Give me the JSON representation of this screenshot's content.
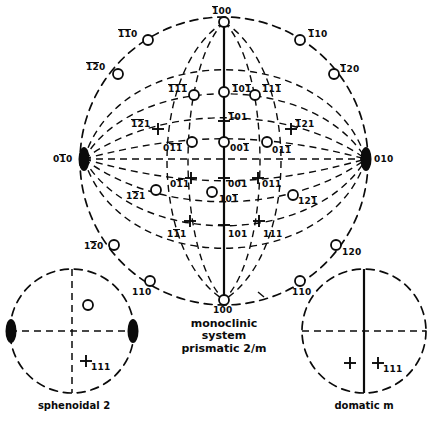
{
  "figure": {
    "title": "monoclinic system prismatic 2/m",
    "main_caption_lines": [
      "monoclinic",
      "system",
      "prismatic 2/m"
    ],
    "sub_figures": [
      {
        "caption": "sphenoidal 2",
        "symbol": "2"
      },
      {
        "caption": "domatic m",
        "symbol": "m"
      }
    ],
    "colors": {
      "ink": "#0b0b0b",
      "background": "#ffffff"
    }
  },
  "main_stereogram": {
    "name": "monoclinic prismatic 2/m stereographic projection",
    "poles": [
      {
        "id": "p-1b00",
        "label": "100",
        "bars": [
          0
        ],
        "marker": "circle",
        "x": 224,
        "y": 22,
        "lx": 212,
        "ly": 7
      },
      {
        "id": "p-1b1b0",
        "label": "110",
        "bars": [
          0,
          1
        ],
        "marker": "circle",
        "x": 148,
        "y": 40,
        "lx": 118,
        "ly": 30
      },
      {
        "id": "p-1b2b0",
        "label": "120",
        "bars": [
          0,
          1
        ],
        "marker": "circle",
        "x": 118,
        "y": 74,
        "lx": 86,
        "ly": 63
      },
      {
        "id": "p-1b10",
        "label": "110",
        "bars": [
          0
        ],
        "marker": "circle",
        "x": 300,
        "y": 40,
        "lx": 308,
        "ly": 30
      },
      {
        "id": "p-1b20",
        "label": "120",
        "bars": [
          0
        ],
        "marker": "circle",
        "x": 334,
        "y": 74,
        "lx": 340,
        "ly": 65
      },
      {
        "id": "p-1b1b1",
        "label": "111",
        "bars": [
          0,
          1,
          2
        ],
        "marker": "circle",
        "x": 194,
        "y": 95,
        "lx": 168,
        "ly": 85
      },
      {
        "id": "p-1b0b1",
        "label": "101",
        "bars": [
          0,
          2
        ],
        "marker": "circle",
        "x": 224,
        "y": 92,
        "lx": 232,
        "ly": 85
      },
      {
        "id": "p-1b11b",
        "label": "111",
        "bars": [
          0,
          2
        ],
        "marker": "circle",
        "x": 255,
        "y": 95,
        "lx": 262,
        "ly": 85
      },
      {
        "id": "p-1b01",
        "label": "101",
        "bars": [
          0
        ],
        "marker": "cross",
        "x": 224,
        "y": 121,
        "lx": 228,
        "ly": 113
      },
      {
        "id": "p-1b2b1",
        "label": "121",
        "bars": [
          0,
          1
        ],
        "marker": "cross",
        "x": 158,
        "y": 129,
        "lx": 131,
        "ly": 120
      },
      {
        "id": "p-1b21",
        "label": "121",
        "bars": [
          0
        ],
        "marker": "cross",
        "x": 291,
        "y": 129,
        "lx": 295,
        "ly": 120
      },
      {
        "id": "p-01b1b",
        "label": "011",
        "bars": [
          1,
          2
        ],
        "marker": "circle",
        "x": 192,
        "y": 142,
        "lx": 163,
        "ly": 144
      },
      {
        "id": "p-001b",
        "label": "001",
        "bars": [
          2
        ],
        "marker": "circle",
        "x": 224,
        "y": 142,
        "lx": 230,
        "ly": 144
      },
      {
        "id": "p-011b",
        "label": "011",
        "bars": [
          2
        ],
        "marker": "circle",
        "x": 267,
        "y": 142,
        "lx": 272,
        "ly": 146
      },
      {
        "id": "p-0b10",
        "label": "010",
        "bars": [
          1
        ],
        "marker": "lens",
        "x": 84,
        "y": 159,
        "lx": 53,
        "ly": 155
      },
      {
        "id": "p-010",
        "label": "010",
        "bars": [],
        "marker": "lens",
        "x": 366,
        "y": 159,
        "lx": 374,
        "ly": 155
      },
      {
        "id": "p-01b1",
        "label": "011",
        "bars": [
          1
        ],
        "marker": "cross",
        "x": 191,
        "y": 178,
        "lx": 170,
        "ly": 180
      },
      {
        "id": "p-001",
        "label": "001",
        "bars": [],
        "marker": "cross",
        "x": 224,
        "y": 178,
        "lx": 228,
        "ly": 180
      },
      {
        "id": "p-011",
        "label": "011",
        "bars": [],
        "marker": "cross",
        "x": 258,
        "y": 178,
        "lx": 262,
        "ly": 180
      },
      {
        "id": "p-101b",
        "label": "101",
        "bars": [
          2
        ],
        "marker": "circle",
        "x": 212,
        "y": 192,
        "lx": 219,
        "ly": 195
      },
      {
        "id": "p-12b1",
        "label": "121",
        "bars": [
          1
        ],
        "marker": "circle",
        "x": 156,
        "y": 190,
        "lx": 126,
        "ly": 192
      },
      {
        "id": "p-121b",
        "label": "121",
        "bars": [
          2
        ],
        "marker": "circle",
        "x": 293,
        "y": 195,
        "lx": 298,
        "ly": 197
      },
      {
        "id": "p-1b11",
        "label": "111",
        "bars": [
          1
        ],
        "marker": "cross",
        "x": 190,
        "y": 221,
        "lx": 167,
        "ly": 230
      },
      {
        "id": "p-101",
        "label": "101",
        "bars": [],
        "marker": "cross",
        "x": 224,
        "y": 225,
        "lx": 228,
        "ly": 230
      },
      {
        "id": "p-111",
        "label": "111",
        "bars": [],
        "marker": "cross",
        "x": 259,
        "y": 221,
        "lx": 263,
        "ly": 230
      },
      {
        "id": "p-1b2b0b",
        "label": "120",
        "bars": [
          1
        ],
        "marker": "circle",
        "x": 114,
        "y": 245,
        "lx": 84,
        "ly": 242
      },
      {
        "id": "p-120",
        "label": "120",
        "bars": [],
        "marker": "circle",
        "x": 336,
        "y": 245,
        "lx": 342,
        "ly": 248
      },
      {
        "id": "p-1b10b",
        "label": "110",
        "bars": [],
        "marker": "circle",
        "x": 150,
        "y": 281,
        "lx": 132,
        "ly": 288
      },
      {
        "id": "p-110",
        "label": "110",
        "bars": [],
        "marker": "circle",
        "x": 300,
        "y": 281,
        "lx": 292,
        "ly": 288
      },
      {
        "id": "p-100",
        "label": "100",
        "bars": [],
        "marker": "circle",
        "x": 224,
        "y": 300,
        "lx": 213,
        "ly": 306
      }
    ]
  },
  "sphenoidal_stereogram": {
    "name": "sphenoidal 2",
    "poles": [
      {
        "id": "s-upper",
        "label": "",
        "marker": "circle",
        "x": 88,
        "y": 305
      },
      {
        "id": "s-lens-left",
        "label": "",
        "marker": "lens",
        "x": 11,
        "y": 331
      },
      {
        "id": "s-lens-right",
        "label": "",
        "marker": "lens",
        "x": 133,
        "y": 331
      },
      {
        "id": "s-cross-111",
        "label": "111",
        "bars": [],
        "marker": "cross",
        "x": 86,
        "y": 361,
        "lx": 91,
        "ly": 363
      }
    ]
  },
  "domatic_stereogram": {
    "name": "domatic m",
    "poles": [
      {
        "id": "d-cross-left",
        "label": "",
        "marker": "cross",
        "x": 350,
        "y": 363
      },
      {
        "id": "d-cross-right",
        "label": "111",
        "bars": [],
        "marker": "cross",
        "x": 378,
        "y": 363,
        "lx": 383,
        "ly": 365
      }
    ]
  },
  "annotations": {
    "tick_mark": "s"
  }
}
